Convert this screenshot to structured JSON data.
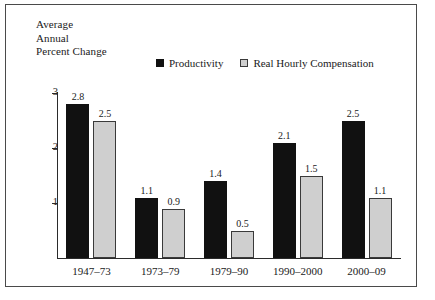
{
  "figure": {
    "axis_title_lines": [
      "Average",
      "Annual",
      "Percent Change"
    ],
    "frame_color": "#4a4a4a",
    "background": "#ffffff"
  },
  "legend": {
    "position": "top-center",
    "entries": [
      {
        "label": "Productivity",
        "swatch": "filled-black-square-icon",
        "color": "#111111"
      },
      {
        "label": "Real Hourly Compensation",
        "swatch": "outlined-gray-square-icon",
        "color": "#cfcfcf"
      }
    ]
  },
  "chart_data": {
    "type": "bar",
    "title": "",
    "subtitle": "",
    "xlabel": "",
    "ylabel": "Average Annual Percent Change",
    "categories": [
      "1947–73",
      "1973–79",
      "1979–90",
      "1990–2000",
      "2000–09"
    ],
    "series": [
      {
        "name": "Productivity",
        "color": "#111111",
        "values": [
          2.8,
          1.1,
          1.4,
          2.1,
          2.5
        ]
      },
      {
        "name": "Real Hourly Compensation",
        "color": "#cfcfcf",
        "values": [
          2.5,
          0.9,
          0.5,
          1.5,
          1.1
        ]
      }
    ],
    "value_labels": {
      "Productivity": [
        "2.8",
        "1.1",
        "1.4",
        "2.1",
        "2.5"
      ],
      "Real Hourly Compensation": [
        "2.5",
        "0.9",
        "0.5",
        "1.5",
        "1.1"
      ]
    },
    "ylim": [
      0,
      3.2
    ],
    "yticks": [
      1,
      2,
      3
    ],
    "ytick_labels": [
      "1",
      "2",
      "3"
    ],
    "grid": false,
    "legend_position": "top-center"
  }
}
